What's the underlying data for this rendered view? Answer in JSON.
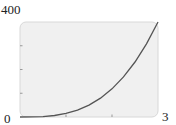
{
  "chart_data": {
    "type": "line",
    "title": "",
    "xlabel": "",
    "ylabel": "",
    "xlim": [
      0,
      3
    ],
    "ylim": [
      0,
      400
    ],
    "x_tick_labels": [
      "0",
      "3"
    ],
    "y_tick_labels": [
      "400"
    ],
    "x_ticks": [
      1,
      2
    ],
    "y_ticks": [
      100,
      200,
      300
    ],
    "grid": false,
    "legend": null,
    "series": [
      {
        "name": "curve",
        "x": [
          0,
          0.25,
          0.5,
          0.75,
          1,
          1.25,
          1.5,
          1.75,
          2,
          2.25,
          2.5,
          2.75,
          3
        ],
        "values": [
          0,
          0.2,
          1.9,
          6.3,
          14.8,
          28.9,
          50,
          79.4,
          118.5,
          168.8,
          231.5,
          308.1,
          400
        ]
      }
    ]
  },
  "labels": {
    "ymax": "400",
    "origin": "0",
    "xmax": "3"
  },
  "colors": {
    "plot_bg": "#f0f0f0",
    "plot_border": "#d8d8d8",
    "curve": "#555555"
  }
}
